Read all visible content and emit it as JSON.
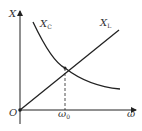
{
  "diagram": {
    "title": "",
    "y_axis_label": "X",
    "x_axis_label": "ω",
    "origin_label": "O",
    "curves": [
      {
        "name": "X_C",
        "label_main": "X",
        "label_sub": "C",
        "shape": "decreasing hyperbola"
      },
      {
        "name": "X_L",
        "label_main": "X",
        "label_sub": "L",
        "shape": "increasing line from origin"
      }
    ],
    "intersection_label_main": "ω",
    "intersection_label_sub": "0",
    "colors": {
      "line": "#222222",
      "text": "#333333"
    }
  }
}
